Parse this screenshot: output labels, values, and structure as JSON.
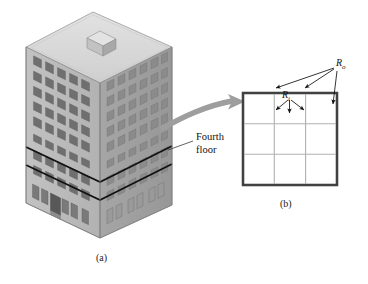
{
  "figure": {
    "title_hidden": "",
    "captions": {
      "a": "(a)",
      "b": "(b)"
    },
    "annotations": {
      "fourth_floor_line1": "Fourth",
      "fourth_floor_line2": "floor",
      "reaction_outer_symbol": "R",
      "reaction_outer_subscript": "o",
      "reaction_inner_symbol": "R",
      "reaction_inner_subscript": "i"
    },
    "colors": {
      "ink": "#111111",
      "building_roof": "#d9d9d9",
      "building_face_left": "#b9b9b9",
      "building_face_right": "#9f9f9f",
      "window_dark": "#6e6e6e",
      "window_mid": "#8a8a8a",
      "grid_outer": "#4a4a4a",
      "grid_inner": "#a8a8a8",
      "arrow_gray": "#9a9a9a",
      "background": "#ffffff"
    },
    "panel_a": {
      "name": "isometric-building",
      "stories_total": 11,
      "highlighted_story": "Fourth floor",
      "roof_feature": "penthouse-cube",
      "ground_floor_feature": "recessed-entrance"
    },
    "panel_b": {
      "name": "fourth-floor-plan",
      "grid_rows": 3,
      "grid_cols": 3,
      "outer_border": "thick",
      "inner_lines": "thin",
      "arrow_count_outer": 3,
      "arrow_count_inner": 3
    }
  }
}
